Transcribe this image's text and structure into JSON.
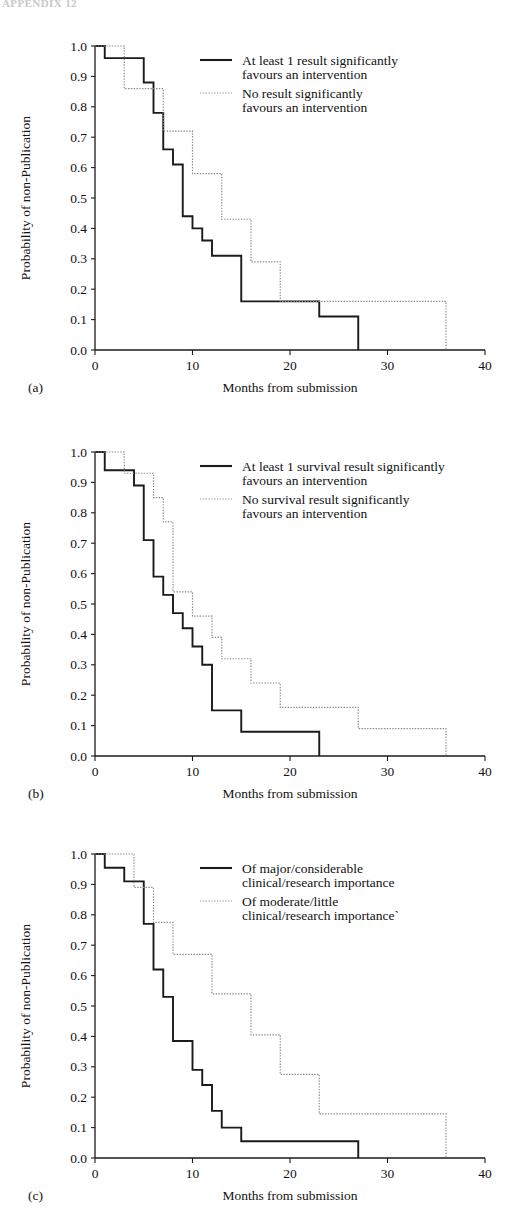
{
  "page": {
    "header_text": "APPENDIX 12"
  },
  "axes": {
    "ylabel": "Probability of non-Publication",
    "xlabel": "Months from submission",
    "yticks": [
      "0.0",
      "0.1",
      "0.2",
      "0.3",
      "0.4",
      "0.5",
      "0.6",
      "0.7",
      "0.8",
      "0.9",
      "1.0"
    ],
    "xticks": [
      "0",
      "10",
      "20",
      "30",
      "40"
    ],
    "ylim": [
      0,
      1
    ],
    "xlim": [
      0,
      40
    ]
  },
  "panels": [
    {
      "id": "a",
      "letter": "(a)",
      "legend": [
        {
          "style": "solid",
          "line1": "At least 1 result significantly",
          "line2": "favours an intervention"
        },
        {
          "style": "dotted",
          "line1": "No result significantly",
          "line2": "favours an intervention"
        }
      ]
    },
    {
      "id": "b",
      "letter": "(b)",
      "legend": [
        {
          "style": "solid",
          "line1": "At least 1 survival result significantly",
          "line2": "favours an intervention"
        },
        {
          "style": "dotted",
          "line1": "No survival result significantly",
          "line2": "favours an intervention"
        }
      ]
    },
    {
      "id": "c",
      "letter": "(c)",
      "legend": [
        {
          "style": "solid",
          "line1": "Of major/considerable",
          "line2": "clinical/research importance"
        },
        {
          "style": "dotted",
          "line1": "Of moderate/little",
          "line2": "clinical/research importance`"
        }
      ]
    }
  ],
  "chart_data": [
    {
      "type": "line",
      "panel": "a",
      "title": "",
      "xlabel": "Months from submission",
      "ylabel": "Probability of non-Publication",
      "xlim": [
        0,
        40
      ],
      "ylim": [
        0,
        1
      ],
      "grid": false,
      "legend_position": "top-right",
      "series": [
        {
          "name": "At least 1 result significantly favours an intervention",
          "style": "solid",
          "steps_x": [
            0,
            1,
            4,
            5,
            6,
            7,
            8,
            9,
            10,
            11,
            12,
            15,
            23,
            27
          ],
          "steps_y": [
            1.0,
            0.96,
            0.96,
            0.88,
            0.78,
            0.66,
            0.61,
            0.44,
            0.4,
            0.36,
            0.31,
            0.16,
            0.11,
            0.06
          ],
          "end_x": 27,
          "end_y": 0.0
        },
        {
          "name": "No result significantly favours an intervention",
          "style": "dotted",
          "steps_x": [
            0,
            3,
            7,
            10,
            13,
            16,
            19,
            36
          ],
          "steps_y": [
            1.0,
            0.86,
            0.72,
            0.58,
            0.43,
            0.29,
            0.16,
            0.16
          ],
          "end_x": 36,
          "end_y": 0.0
        }
      ]
    },
    {
      "type": "line",
      "panel": "b",
      "title": "",
      "xlabel": "Months from submission",
      "ylabel": "Probability of non-Publication",
      "xlim": [
        0,
        40
      ],
      "ylim": [
        0,
        1
      ],
      "grid": false,
      "legend_position": "top-right",
      "series": [
        {
          "name": "At least 1 survival result significantly favours an intervention",
          "style": "solid",
          "steps_x": [
            0,
            1,
            4,
            5,
            6,
            7,
            8,
            9,
            10,
            11,
            12,
            15,
            23
          ],
          "steps_y": [
            1.0,
            0.94,
            0.89,
            0.71,
            0.59,
            0.53,
            0.47,
            0.42,
            0.36,
            0.3,
            0.15,
            0.08,
            0.08
          ],
          "end_x": 23,
          "end_y": 0.0
        },
        {
          "name": "No survival result significantly favours an intervention",
          "style": "dotted",
          "steps_x": [
            0,
            3,
            5,
            6,
            7,
            8,
            10,
            12,
            13,
            16,
            19,
            27,
            36
          ],
          "steps_y": [
            1.0,
            0.93,
            0.93,
            0.85,
            0.77,
            0.54,
            0.46,
            0.39,
            0.32,
            0.24,
            0.16,
            0.09,
            0.09
          ],
          "end_x": 36,
          "end_y": 0.0
        }
      ]
    },
    {
      "type": "line",
      "panel": "c",
      "title": "",
      "xlabel": "Months from submission",
      "ylabel": "Probability of non-Publication",
      "xlim": [
        0,
        40
      ],
      "ylim": [
        0,
        1
      ],
      "grid": false,
      "legend_position": "top-right",
      "series": [
        {
          "name": "Of major/considerable clinical/research importance",
          "style": "solid",
          "steps_x": [
            0,
            1,
            3,
            5,
            6,
            7,
            8,
            10,
            11,
            12,
            13,
            15,
            27
          ],
          "steps_y": [
            1.0,
            0.955,
            0.91,
            0.77,
            0.62,
            0.53,
            0.385,
            0.29,
            0.24,
            0.155,
            0.1,
            0.055,
            0.055
          ],
          "end_x": 27,
          "end_y": 0.0
        },
        {
          "name": "Of moderate/little clinical/research importance",
          "style": "dotted",
          "steps_x": [
            0,
            4,
            6,
            8,
            12,
            16,
            19,
            23,
            36
          ],
          "steps_y": [
            1.0,
            0.89,
            0.775,
            0.67,
            0.54,
            0.405,
            0.275,
            0.145,
            0.145
          ],
          "end_x": 36,
          "end_y": 0.0
        }
      ]
    }
  ]
}
